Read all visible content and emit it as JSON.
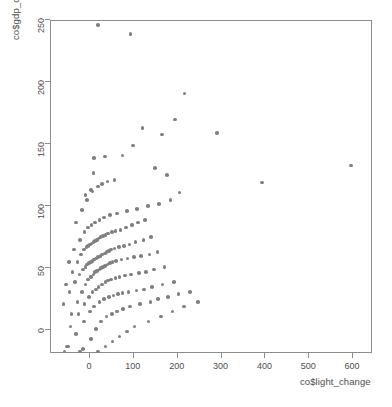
{
  "chart_data": {
    "type": "scatter",
    "title": "",
    "xlabel": "co$light_change",
    "ylabel": "co$gdp_change",
    "xlim": [
      -110,
      640
    ],
    "ylim": [
      -30,
      262
    ],
    "xticks": [
      0,
      100,
      200,
      300,
      400,
      500,
      600
    ],
    "yticks": [
      0,
      50,
      100,
      150,
      200,
      250
    ],
    "grid": false,
    "legend": null,
    "point_color": "#808080",
    "point_shape": "filled-circle",
    "frame": true,
    "x": [
      20,
      95,
      597,
      292,
      218,
      196,
      395,
      166,
      122,
      100,
      76,
      36,
      12,
      10,
      5,
      -8,
      150,
      178,
      206,
      58,
      42,
      30,
      20,
      8,
      -4,
      -16,
      -30,
      186,
      160,
      134,
      110,
      86,
      64,
      48,
      34,
      24,
      14,
      6,
      -2,
      -10,
      -20,
      -34,
      -46,
      128,
      112,
      98,
      84,
      72,
      60,
      52,
      44,
      38,
      32,
      26,
      22,
      18,
      14,
      10,
      6,
      2,
      -2,
      -6,
      -12,
      -18,
      -26,
      -38,
      -52,
      142,
      124,
      106,
      92,
      80,
      68,
      58,
      50,
      46,
      40,
      36,
      30,
      26,
      20,
      16,
      12,
      8,
      4,
      0,
      -4,
      -8,
      -14,
      -22,
      -32,
      -44,
      -58,
      156,
      138,
      118,
      102,
      88,
      74,
      62,
      54,
      48,
      42,
      36,
      32,
      28,
      24,
      18,
      14,
      10,
      4,
      -2,
      -8,
      -16,
      -26,
      -40,
      172,
      148,
      130,
      114,
      96,
      82,
      70,
      60,
      50,
      44,
      38,
      30,
      22,
      16,
      8,
      0,
      -10,
      -24,
      -42,
      194,
      168,
      144,
      126,
      108,
      90,
      76,
      66,
      56,
      46,
      34,
      24,
      12,
      2,
      -12,
      -30,
      -50,
      230,
      204,
      180,
      158,
      140,
      116,
      94,
      78,
      64,
      52,
      40,
      28,
      16,
      4,
      -14,
      -36,
      -56,
      248,
      216,
      190,
      164,
      136,
      104,
      86,
      70,
      54,
      38,
      20,
      0,
      -20,
      -48
    ],
    "y": [
      245,
      238,
      132,
      158,
      190,
      169,
      118,
      157,
      162,
      148,
      140,
      139,
      138,
      126,
      112,
      108,
      130,
      124,
      110,
      120,
      119,
      117,
      115,
      111,
      104,
      96,
      86,
      104,
      101,
      99,
      97,
      95,
      93,
      92,
      90,
      88,
      86,
      84,
      82,
      78,
      72,
      64,
      54,
      88,
      86,
      84,
      82,
      80,
      79,
      78,
      77,
      76,
      75,
      74,
      73,
      72,
      71,
      70,
      69,
      68,
      67,
      66,
      64,
      60,
      54,
      46,
      36,
      74,
      72,
      70,
      68,
      67,
      66,
      65,
      64,
      63,
      62,
      61,
      60,
      59,
      58,
      57,
      56,
      55,
      54,
      53,
      52,
      50,
      48,
      44,
      38,
      30,
      20,
      62,
      60,
      59,
      58,
      57,
      56,
      55,
      54,
      53,
      52,
      51,
      50,
      49,
      48,
      47,
      46,
      44,
      42,
      40,
      36,
      30,
      22,
      12,
      50,
      48,
      46,
      45,
      44,
      43,
      42,
      41,
      40,
      39,
      38,
      36,
      34,
      32,
      30,
      26,
      20,
      12,
      2,
      38,
      36,
      34,
      32,
      31,
      30,
      29,
      28,
      27,
      26,
      24,
      22,
      18,
      14,
      6,
      -4,
      -14,
      30,
      28,
      26,
      24,
      22,
      20,
      18,
      16,
      14,
      12,
      10,
      6,
      0,
      -8,
      -16,
      -20,
      -18,
      22,
      18,
      14,
      10,
      6,
      2,
      -2,
      -6,
      -10,
      -14,
      -18,
      -20,
      -18,
      -14
    ]
  }
}
